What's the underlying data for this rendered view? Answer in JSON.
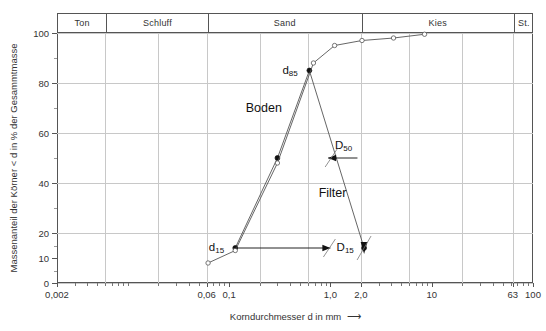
{
  "chart_data": {
    "type": "line",
    "title": "",
    "xlabel": "Korndurchmesser d in mm",
    "ylabel": "Massenanteil der Körner < d in % der Gesammtmasse",
    "xscale": "log",
    "xlim": [
      0.002,
      100
    ],
    "ylim": [
      0,
      100
    ],
    "grid": true,
    "legend": "inline-annotations",
    "x_ticks": [
      {
        "value": 0.002,
        "label": "0,002"
      },
      {
        "value": 0.06,
        "label": "0,06"
      },
      {
        "value": 0.1,
        "label": "0,1"
      },
      {
        "value": 1.0,
        "label": "1,0"
      },
      {
        "value": 2.0,
        "label": "2,0"
      },
      {
        "value": 10,
        "label": "10"
      },
      {
        "value": 63,
        "label": "63"
      },
      {
        "value": 100,
        "label": "100"
      }
    ],
    "y_ticks": [
      {
        "value": 0,
        "label": "0"
      },
      {
        "value": 10,
        "label": "10"
      },
      {
        "value": 20,
        "label": "20"
      },
      {
        "value": 40,
        "label": "40"
      },
      {
        "value": 60,
        "label": "60"
      },
      {
        "value": 80,
        "label": "80"
      },
      {
        "value": 100,
        "label": "100"
      }
    ],
    "y_minor_ticks": [
      5,
      15,
      30,
      50,
      70,
      90
    ],
    "y_gridlines": [
      0,
      20,
      40,
      60,
      80,
      100
    ],
    "x_gridlines": [
      0.006,
      0.02,
      0.06,
      0.2,
      0.6,
      2.0,
      6.0,
      20,
      63
    ],
    "soil_classes": [
      {
        "name": "Ton",
        "from": 0.002,
        "to": 0.006
      },
      {
        "name": "Schluff",
        "from": 0.006,
        "to": 0.06
      },
      {
        "name": "Sand",
        "from": 0.06,
        "to": 2.0
      },
      {
        "name": "Kies",
        "from": 2.0,
        "to": 63
      },
      {
        "name": "St.",
        "from": 63,
        "to": 100
      }
    ],
    "series": [
      {
        "name": "Boden",
        "marker": "filled-circle",
        "points": [
          {
            "x": 0.115,
            "y": 14
          },
          {
            "x": 0.3,
            "y": 50
          },
          {
            "x": 0.62,
            "y": 85
          },
          {
            "x": 2.15,
            "y": 14
          }
        ]
      },
      {
        "name": "Filter",
        "marker": "open-circle",
        "points": [
          {
            "x": 0.062,
            "y": 8
          },
          {
            "x": 0.115,
            "y": 13
          },
          {
            "x": 0.3,
            "y": 48
          },
          {
            "x": 0.68,
            "y": 88
          },
          {
            "x": 1.1,
            "y": 95
          },
          {
            "x": 2.05,
            "y": 97
          },
          {
            "x": 4.2,
            "y": 98
          },
          {
            "x": 8.5,
            "y": 99.5
          }
        ]
      }
    ],
    "annotations": [
      {
        "name": "d85",
        "text": "d85",
        "base": "d",
        "sub": "85",
        "x": 0.4,
        "y": 85
      },
      {
        "name": "d15",
        "text": "d15",
        "base": "d",
        "sub": "15",
        "x": 0.075,
        "y": 14
      },
      {
        "name": "D50",
        "text": "D50",
        "base": "D",
        "sub": "50",
        "x": 1.35,
        "y": 55
      },
      {
        "name": "D15",
        "text": "D15",
        "base": "D",
        "sub": "15",
        "x": 1.4,
        "y": 14
      },
      {
        "name": "Boden",
        "text": "Boden",
        "x": 0.22,
        "y": 70
      },
      {
        "name": "Filter",
        "text": "Filter",
        "x": 1.05,
        "y": 36
      }
    ],
    "arrow_annotations": [
      {
        "name": "d15-to-D15-arrow",
        "direction": "right",
        "from_x": 0.115,
        "to_x": 1.0,
        "y": 14
      },
      {
        "name": "D50-arrow",
        "direction": "left",
        "from_x": 1.85,
        "to_x": 0.95,
        "y": 50
      },
      {
        "name": "D15-endpoint-arrow",
        "direction": "down",
        "x": 2.15,
        "y": 14
      }
    ]
  },
  "axis": {
    "y_title": "Massenanteil der Körner < d in % der Gesammtmasse",
    "x_title": "Korndurchmesser d in mm",
    "x_title_arrow": "⟶"
  }
}
